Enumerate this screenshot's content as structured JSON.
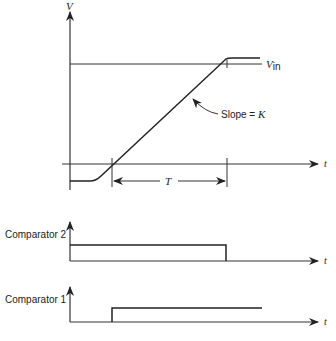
{
  "diagram": {
    "top_plot": {
      "y_axis_label": "V",
      "x_axis_label": "t",
      "reference_label": "V",
      "reference_subscript": "in",
      "slope_label": "Slope = ",
      "slope_symbol": "K",
      "interval_label": "T"
    },
    "comparator2": {
      "label": "Comparator  2",
      "x_axis_label": "t"
    },
    "comparator1": {
      "label": "Comparator  1",
      "x_axis_label": "t"
    }
  }
}
